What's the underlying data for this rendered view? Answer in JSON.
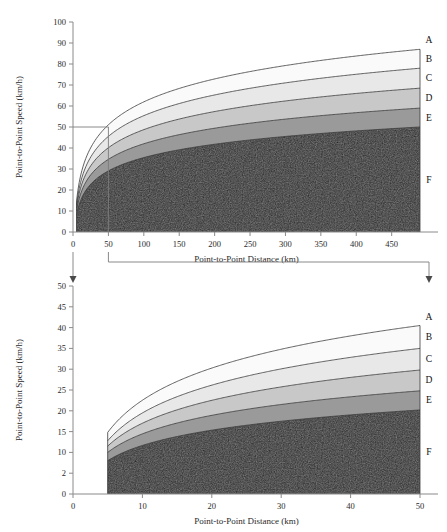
{
  "chart_data": [
    {
      "type": "area",
      "panel": "top",
      "title": "",
      "xlabel": "Point-to-Point Distance (km)",
      "ylabel": "Point-to-Point Speed (km/h)",
      "xlim": [
        0,
        490
      ],
      "ylim": [
        0,
        100
      ],
      "xticks": [
        0,
        50,
        100,
        150,
        200,
        250,
        300,
        350,
        400,
        450
      ],
      "xtick_labels": [
        "0",
        "50",
        "100",
        "150",
        "200",
        "250",
        "300",
        "350",
        "400",
        "450"
      ],
      "yticks": [
        0,
        10,
        20,
        30,
        40,
        50,
        60,
        70,
        80,
        90,
        100
      ],
      "ytick_labels": [
        "0",
        "10",
        "20",
        "30",
        "40",
        "50",
        "60",
        "70",
        "80",
        "90",
        "100"
      ],
      "grid": false,
      "legend_position": "right-inline",
      "x_start": 5,
      "x_end": 490,
      "stacked": true,
      "series": [
        {
          "name": "F",
          "label": "F",
          "color": "#262626",
          "boundary_at_x_start": 8.0,
          "boundary_at_x_end": 50.0
        },
        {
          "name": "E",
          "label": "E",
          "color": "#9a9a9a",
          "boundary_at_x_start": 10.0,
          "boundary_at_x_end": 59.0
        },
        {
          "name": "D",
          "label": "D",
          "color": "#c8c8c8",
          "boundary_at_x_start": 11.5,
          "boundary_at_x_end": 68.5
        },
        {
          "name": "C",
          "label": "C",
          "color": "#e8e8e8",
          "boundary_at_x_start": 12.8,
          "boundary_at_x_end": 78.0
        },
        {
          "name": "B",
          "label": "B",
          "color": "#fafafa",
          "boundary_at_x_start": 14.8,
          "boundary_at_x_end": 87.0
        },
        {
          "name": "A",
          "label": "A",
          "color": "#ffffff",
          "boundary_at_x_start": null,
          "boundary_at_x_end": null
        }
      ]
    },
    {
      "type": "area",
      "panel": "bottom",
      "title": "",
      "xlabel": "Point-to-Point Distance (km)",
      "ylabel": "Point-to-Point Speed (km/h)",
      "xlim": [
        0,
        50
      ],
      "ylim": [
        0,
        50
      ],
      "xticks": [
        0,
        10,
        20,
        30,
        40,
        50
      ],
      "xtick_labels": [
        "0",
        "10",
        "20",
        "30",
        "40",
        "50"
      ],
      "yticks": [
        0,
        5,
        10,
        15,
        20,
        25,
        30,
        35,
        40,
        45,
        50
      ],
      "ytick_labels": [
        "0",
        "2",
        "10",
        "15",
        "20",
        "25",
        "30",
        "35",
        "40",
        "45",
        "50"
      ],
      "grid": false,
      "legend_position": "right-inline",
      "x_start": 5,
      "x_end": 50,
      "stacked": true,
      "series": [
        {
          "name": "F",
          "label": "F",
          "color": "#262626",
          "boundary_at_x_start": 8.0,
          "boundary_at_x_end": 20.2
        },
        {
          "name": "E",
          "label": "E",
          "color": "#9a9a9a",
          "boundary_at_x_start": 10.0,
          "boundary_at_x_end": 24.8
        },
        {
          "name": "D",
          "label": "D",
          "color": "#c8c8c8",
          "boundary_at_x_start": 11.5,
          "boundary_at_x_end": 29.8
        },
        {
          "name": "C",
          "label": "C",
          "color": "#e8e8e8",
          "boundary_at_x_start": 12.8,
          "boundary_at_x_end": 35.0
        },
        {
          "name": "B",
          "label": "B",
          "color": "#fafafa",
          "boundary_at_x_start": 14.8,
          "boundary_at_x_end": 40.5
        },
        {
          "name": "A",
          "label": "A",
          "color": "#ffffff",
          "boundary_at_x_start": null,
          "boundary_at_x_end": null
        }
      ]
    }
  ],
  "callout": {
    "region_x": [
      0,
      50
    ],
    "region_y": [
      0,
      50
    ],
    "description": "magnified-detail-link"
  }
}
